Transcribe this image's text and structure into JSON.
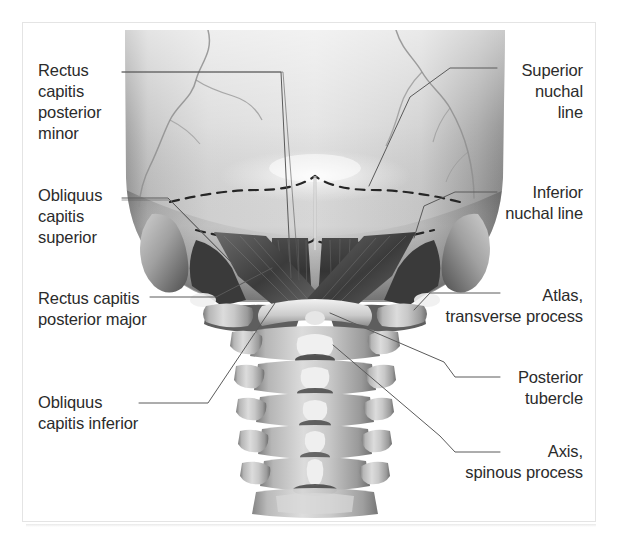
{
  "figure": {
    "kind": "anatomical-illustration",
    "view": "posterior view of occipital bone, suboccipital muscles and cervical spine",
    "colors": {
      "background": "#ffffff",
      "frame_border": "#e4e4e4",
      "label_text": "#2b2b2b",
      "leader_line": "#5a5a5a",
      "bone_light": "#d9d9d9",
      "bone_mid": "#b3b3b3",
      "bone_shadow": "#6e6e6e",
      "muscle_dark": "#3f3f3f",
      "muscle_mid": "#6a6a6a",
      "dashed_nuchal_line": "#2e2e2e"
    }
  },
  "labels": {
    "rectus_capitis_posterior_minor": "Rectus\ncapitis\nposterior\nminor",
    "obliquus_capitis_superior": "Obliquus\ncapitis\nsuperior",
    "rectus_capitis_posterior_major": "Rectus capitis\nposterior major",
    "obliquus_capitis_inferior": "Obliquus\ncapitis inferior",
    "superior_nuchal_line": "Superior\nnuchal\nline",
    "inferior_nuchal_line": "Inferior\nnuchal line",
    "atlas_transverse_process": "Atlas,\ntransverse process",
    "posterior_tubercle": "Posterior\ntubercle",
    "axis_spinous_process": "Axis,\nspinous process"
  }
}
